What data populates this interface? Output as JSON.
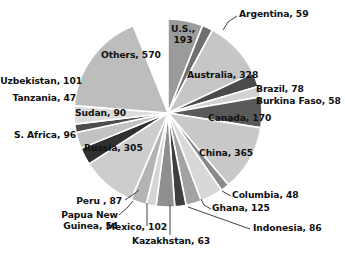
{
  "chart_data": {
    "type": "pie",
    "title": "",
    "subtitle": "",
    "xlabel": "",
    "ylabel": "",
    "legend_position": "none",
    "labels_on_slices": true,
    "label_format": "name, value",
    "total": 3217,
    "categories": [
      "U.S.",
      "Argentina",
      "Australia",
      "Brazil",
      "Burkina Faso",
      "Canada",
      "China",
      "Columbia",
      "Ghana",
      "Indonesia",
      "Kazakhstan",
      "Mexico",
      "Papua New Guinea",
      "Peru",
      "Russia",
      "S. Africa",
      "Sudan",
      "Tanzania",
      "Uzbekistan",
      "Others"
    ],
    "values": [
      193,
      59,
      328,
      78,
      58,
      170,
      365,
      48,
      125,
      86,
      63,
      102,
      54,
      87,
      305,
      96,
      90,
      47,
      101,
      570
    ],
    "slices": [
      {
        "name": "U.S.",
        "value": 193,
        "label": "U.S., 193",
        "color": "#9b9b9b",
        "start_angle": 0,
        "end_angle": 21.6
      },
      {
        "name": "Argentina",
        "value": 59,
        "label": "Argentina, 59",
        "color": "#6e6e6e",
        "start_angle": 21.6,
        "end_angle": 28.2
      },
      {
        "name": "Australia",
        "value": 328,
        "label": "Australia, 328",
        "color": "#c6c6c6",
        "start_angle": 28.2,
        "end_angle": 64.9
      },
      {
        "name": "Brazil",
        "value": 78,
        "label": "Brazil, 78",
        "color": "#4a4a4a",
        "start_angle": 64.9,
        "end_angle": 73.6
      },
      {
        "name": "Burkina Faso",
        "value": 58,
        "label": "Burkina Faso, 58",
        "color": "#d2d2d2",
        "start_angle": 73.6,
        "end_angle": 80.1
      },
      {
        "name": "Canada",
        "value": 170,
        "label": "Canada, 170",
        "color": "#5a5a5a",
        "start_angle": 80.1,
        "end_angle": 99.1
      },
      {
        "name": "China",
        "value": 365,
        "label": "China, 365",
        "color": "#c9c9c9",
        "start_angle": 99.1,
        "end_angle": 139.9
      },
      {
        "name": "Columbia",
        "value": 48,
        "label": "Columbia, 48",
        "color": "#8a8a8a",
        "start_angle": 139.9,
        "end_angle": 145.3
      },
      {
        "name": "Ghana",
        "value": 125,
        "label": "Ghana, 125",
        "color": "#d8d8d8",
        "start_angle": 145.3,
        "end_angle": 159.3
      },
      {
        "name": "Indonesia",
        "value": 86,
        "label": "Indonesia, 86",
        "color": "#a3a3a3",
        "start_angle": 159.3,
        "end_angle": 168.9
      },
      {
        "name": "Kazakhstan",
        "value": 63,
        "label": "Kazakhstan, 63",
        "color": "#3f3f3f",
        "start_angle": 168.9,
        "end_angle": 175.9
      },
      {
        "name": "Mexico",
        "value": 102,
        "label": "Mexico, 102",
        "color": "#8f8f8f",
        "start_angle": 175.9,
        "end_angle": 187.3
      },
      {
        "name": "Papua New Guinea",
        "value": 54,
        "label": "Papua New Guinea, 54",
        "color": "#d5d5d5",
        "start_angle": 187.3,
        "end_angle": 193.4
      },
      {
        "name": "Peru",
        "value": 87,
        "label": "Peru , 87",
        "color": "#b4b4b4",
        "start_angle": 193.4,
        "end_angle": 203.1
      },
      {
        "name": "Russia",
        "value": 305,
        "label": "Russia, 305",
        "color": "#cdcdcd",
        "start_angle": 203.1,
        "end_angle": 237.2
      },
      {
        "name": "S. Africa",
        "value": 96,
        "label": "S. Africa, 96",
        "color": "#303030",
        "start_angle": 237.2,
        "end_angle": 247.9
      },
      {
        "name": "Sudan",
        "value": 90,
        "label": "Sudan, 90",
        "color": "#c2c2c2",
        "start_angle": 247.9,
        "end_angle": 258.0
      },
      {
        "name": "Tanzania",
        "value": 47,
        "label": "Tanzania, 47",
        "color": "#4d4d4d",
        "start_angle": 258.0,
        "end_angle": 263.2
      },
      {
        "name": "Uzbekistan",
        "value": 101,
        "label": "Uzbekistan, 101",
        "color": "#dcdcdc",
        "start_angle": 263.2,
        "end_angle": 274.5
      },
      {
        "name": "Others",
        "value": 570,
        "label": "Others, 570",
        "color": "#bdbdbd",
        "start_angle": 274.5,
        "end_angle": 338.3
      }
    ]
  },
  "labels": {
    "us_line1": "U.S.,",
    "us_line2": "193",
    "argentina": "Argentina, 59",
    "australia": "Australia, 328",
    "brazil": "Brazil, 78",
    "burkina_faso": "Burkina Faso, 58",
    "canada": "Canada, 170",
    "china": "China, 365",
    "columbia": "Columbia, 48",
    "ghana": "Ghana, 125",
    "indonesia": "Indonesia, 86",
    "kazakhstan": "Kazakhstan, 63",
    "mexico": "Mexico, 102",
    "papua_line1": "Papua New",
    "papua_line2": "Guinea, 54",
    "peru": "Peru , 87",
    "russia": "Russia, 305",
    "s_africa": "S. Africa, 96",
    "sudan": "Sudan, 90",
    "tanzania": "Tanzania, 47",
    "uzbekistan": "Uzbekistan, 101",
    "others": "Others, 570"
  },
  "geometry": {
    "center_x": 168,
    "center_y": 113,
    "radius": 94
  },
  "colors": {
    "background": "#ffffff",
    "text": "#111111",
    "slice_border": "#ffffff",
    "leader_line": "#2b2b2b"
  }
}
